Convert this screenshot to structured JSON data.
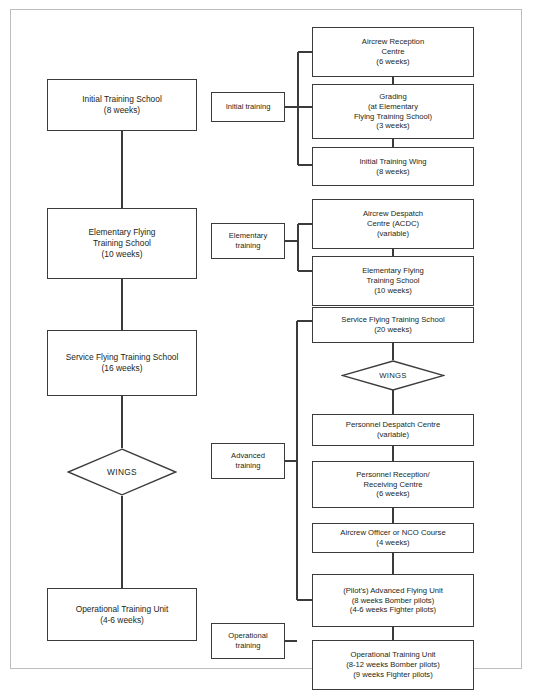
{
  "diagram": {
    "colors": {
      "border": "#3b3b3b",
      "frame": "#bdbdbd",
      "text": "#231f20",
      "background": "#ffffff"
    },
    "left_column": [
      {
        "id": "initial-training-school",
        "lines": [
          "Initial Training School",
          "(8 weeks)"
        ]
      },
      {
        "id": "elementary-flying-training-school",
        "lines": [
          "Elementary Flying",
          "Training School",
          "(10 weeks)"
        ]
      },
      {
        "id": "service-flying-training-school",
        "lines": [
          "Service Flying Training School",
          "(16 weeks)"
        ]
      },
      {
        "id": "wings",
        "lines": [
          "WINGS"
        ],
        "shape": "diamond"
      },
      {
        "id": "operational-training-unit",
        "lines": [
          "Operational Training Unit",
          "(4-6 weeks)"
        ]
      }
    ],
    "stage_labels": [
      {
        "id": "initial-training",
        "lines": [
          "Initial training"
        ]
      },
      {
        "id": "elementary-training",
        "lines": [
          "Elementary",
          "training"
        ]
      },
      {
        "id": "advanced-training",
        "lines": [
          "Advanced",
          "training"
        ]
      },
      {
        "id": "operational-training",
        "lines": [
          "Operational",
          "training"
        ]
      }
    ],
    "right_column": [
      {
        "id": "aircrew-reception-centre",
        "lines": [
          "Aircrew Reception",
          "Centre",
          "(6 weeks)"
        ]
      },
      {
        "id": "grading",
        "lines": [
          "Grading",
          "(at Elementary",
          "Flying Training School)",
          "(3 weeks)"
        ]
      },
      {
        "id": "initial-training-wing",
        "lines": [
          "Initial Training Wing",
          "(8 weeks)"
        ]
      },
      {
        "id": "aircrew-despatch-centre",
        "lines": [
          "Aircrew Despatch",
          "Centre (ACDC)",
          "(variable)"
        ]
      },
      {
        "id": "elementary-flying-training-school-right",
        "lines": [
          "Elementary Flying",
          "Training School",
          "(10 weeks)"
        ]
      },
      {
        "id": "service-flying-training-school-right",
        "lines": [
          "Service Flying Training School",
          "(20 weeks)"
        ]
      },
      {
        "id": "wings-right",
        "lines": [
          "WINGS"
        ],
        "shape": "diamond"
      },
      {
        "id": "personnel-despatch-centre",
        "lines": [
          "Personnel Despatch Centre",
          "(variable)"
        ]
      },
      {
        "id": "personnel-reception-receiving-centre",
        "lines": [
          "Personnel Reception/",
          "Receiving Centre",
          "(6 weeks)"
        ]
      },
      {
        "id": "aircrew-officer-or-nco-course",
        "lines": [
          "Aircrew Officer or NCO Course",
          "(4 weeks)"
        ]
      },
      {
        "id": "pilots-advanced-flying-unit",
        "lines": [
          "(Pilot's) Advanced Flying Unit",
          "(8 weeks Bomber pilots)",
          "(4-6 weeks Fighter pilots)"
        ]
      },
      {
        "id": "operational-training-unit-right",
        "lines": [
          "Operational Training Unit",
          "(8-12 weeks Bomber pilots)",
          "(9 weeks Fighter pilots)"
        ]
      }
    ],
    "caption": ""
  }
}
